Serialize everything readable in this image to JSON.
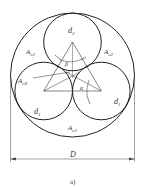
{
  "diagram": {
    "type": "three-circle packing cross-section",
    "labels": {
      "d2": {
        "main": "d",
        "sub": "2"
      },
      "d1_left": {
        "main": "d",
        "sub": "1"
      },
      "d1_right": {
        "main": "d",
        "sub": "1"
      },
      "ac2_top_left": {
        "main": "A",
        "sub": "c2"
      },
      "ac2_top_right": {
        "main": "A",
        "sub": "c2"
      },
      "ac2_bottom": {
        "main": "A",
        "sub": "c2"
      },
      "ac0": {
        "main": "A",
        "sub": "c0"
      },
      "alpha": "α",
      "beta": "β",
      "D": "D"
    },
    "caption": "a)",
    "colors": {
      "stroke": "#222222",
      "text": "#333333"
    }
  }
}
